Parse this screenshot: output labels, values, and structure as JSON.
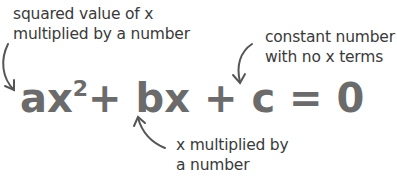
{
  "annotations": {
    "squared": {
      "line1": "squared value of x",
      "line2": "multiplied by a number"
    },
    "constant": {
      "line1": "constant number",
      "line2": "with no x terms"
    },
    "linear": {
      "line1": "x multiplied by",
      "line2": "a number"
    }
  },
  "equation": {
    "term1": "ax",
    "exponent": "2",
    "op1": "+",
    "term2": "bx",
    "op2": "+",
    "term3": "c",
    "eq": "=",
    "rhs": "0"
  },
  "colors": {
    "equation": "#6b6b6b",
    "text": "#3a3a3a",
    "arrow": "#555555"
  }
}
